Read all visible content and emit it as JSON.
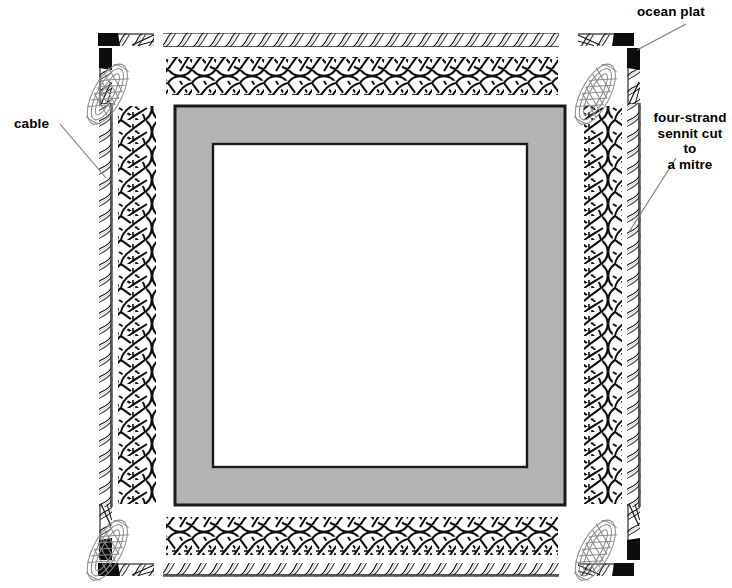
{
  "figure": {
    "background_color": "#ffffff",
    "ink_color": "#000000"
  },
  "labels": {
    "ocean_plat": "ocean plat",
    "cable": "cable",
    "sennit": "four-strand\nsennit cut to\na mitre"
  },
  "frame": {
    "name": "picture frame mat",
    "mat_color": "#b4b4b4",
    "border_color": "#1a1a1a",
    "inner_color": "#ffffff",
    "outer": {
      "x": 175,
      "y": 106,
      "width": 390,
      "height": 399
    },
    "inner": {
      "x": 213,
      "y": 144,
      "width": 314,
      "height": 323
    }
  },
  "components": {
    "cable": {
      "name": "three-strand twisted cable",
      "description": "laid rope shown as a straight run with diagonal strand lines"
    },
    "sennit": {
      "name": "four-strand flat sennit braid",
      "description": "flat plaited braid forming the frame border"
    },
    "ocean_plat": {
      "name": "ocean plat knot",
      "description": "elongated oval interlaced mat knot at each corner"
    },
    "whipped_end": {
      "name": "whipped rope end",
      "description": "solid black seizing at a cut rope end"
    }
  },
  "leader_lines": [
    {
      "name": "ocean-plat-leader",
      "from": [
        686,
        24
      ],
      "to": [
        637,
        50
      ]
    },
    {
      "name": "cable-leader",
      "from": [
        60,
        124
      ],
      "to": [
        106,
        178
      ]
    },
    {
      "name": "sennit-leader",
      "from": [
        676,
        158
      ],
      "to": [
        629,
        232
      ]
    }
  ],
  "chart_data": {
    "type": "diagram",
    "annotations": [
      "ocean plat",
      "cable",
      "four-strand sennit cut to a mitre"
    ]
  }
}
